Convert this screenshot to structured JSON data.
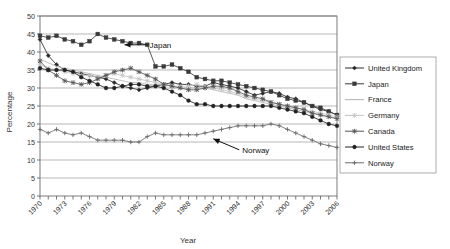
{
  "chart_data": {
    "type": "line",
    "title": "",
    "xlabel": "Year",
    "ylabel": "Percentage",
    "ylim": [
      0,
      50
    ],
    "ytick_step": 5,
    "yticks": [
      "0",
      "5",
      "10",
      "15",
      "20",
      "25",
      "30",
      "35",
      "40",
      "45",
      "50"
    ],
    "xlim": [
      1970,
      2006
    ],
    "xtick_step": 1,
    "xtick_labels": [
      "1970",
      "1973",
      "1976",
      "1979",
      "1982",
      "1985",
      "1988",
      "1991",
      "1994",
      "1997",
      "2000",
      "2003",
      "2006"
    ],
    "xtick_label_step": 3,
    "grid": "horizontal",
    "legend_position": "right",
    "x": [
      1970,
      1971,
      1972,
      1973,
      1974,
      1975,
      1976,
      1977,
      1978,
      1979,
      1980,
      1981,
      1982,
      1983,
      1984,
      1985,
      1986,
      1987,
      1988,
      1989,
      1990,
      1991,
      1992,
      1993,
      1994,
      1995,
      1996,
      1997,
      1998,
      1999,
      2000,
      2001,
      2002,
      2003,
      2004,
      2005,
      2006
    ],
    "series": [
      {
        "name": "United Kingdom",
        "marker": "diamond",
        "color": "#2b2b2b",
        "values": [
          43.5,
          39.0,
          36.5,
          35.0,
          34.5,
          34.0,
          33.5,
          33.0,
          32.5,
          31.5,
          30.5,
          30.0,
          29.5,
          30.0,
          30.5,
          31.0,
          31.5,
          31.0,
          31.0,
          30.5,
          30.5,
          31.5,
          31.0,
          30.5,
          30.0,
          29.0,
          28.0,
          28.5,
          29.0,
          28.5,
          27.5,
          27.0,
          26.0,
          25.0,
          24.0,
          23.5,
          22.5
        ]
      },
      {
        "name": "Japan",
        "marker": "square",
        "color": "#3a3a3a",
        "values": [
          44.5,
          44.0,
          44.5,
          43.5,
          43.0,
          42.0,
          43.0,
          45.0,
          44.0,
          43.5,
          43.0,
          42.5,
          42.5,
          42.0,
          36.0,
          36.0,
          36.5,
          35.5,
          34.5,
          33.0,
          32.5,
          32.0,
          32.0,
          31.5,
          31.0,
          30.5,
          30.0,
          29.5,
          29.0,
          28.0,
          27.0,
          26.5,
          26.0,
          25.0,
          24.5,
          23.5,
          22.5
        ]
      },
      {
        "name": "France",
        "marker": "line",
        "color": "#b9b9b9",
        "values": [
          38.0,
          37.0,
          36.0,
          35.5,
          35.0,
          34.5,
          34.0,
          33.5,
          33.0,
          32.5,
          32.0,
          31.5,
          31.5,
          31.0,
          31.0,
          31.0,
          30.5,
          30.0,
          30.0,
          30.0,
          30.0,
          29.5,
          29.0,
          28.5,
          28.0,
          27.0,
          26.5,
          26.0,
          25.5,
          25.0,
          24.5,
          24.0,
          23.5,
          23.0,
          22.5,
          22.0,
          21.5
        ]
      },
      {
        "name": "Germany",
        "marker": "x-light",
        "color": "#c8c8c8",
        "values": [
          36.5,
          35.5,
          35.0,
          34.5,
          34.0,
          33.5,
          33.5,
          33.0,
          33.5,
          34.0,
          33.5,
          33.0,
          32.5,
          32.0,
          31.5,
          31.0,
          30.5,
          30.5,
          30.5,
          31.0,
          30.5,
          30.0,
          29.5,
          29.0,
          28.5,
          27.5,
          27.0,
          26.5,
          26.0,
          25.5,
          25.0,
          24.5,
          24.0,
          23.5,
          23.0,
          22.5,
          22.0
        ]
      },
      {
        "name": "Canada",
        "marker": "x-dark",
        "color": "#555555",
        "values": [
          37.5,
          35.0,
          33.5,
          32.0,
          31.5,
          31.0,
          31.5,
          32.5,
          33.5,
          34.5,
          35.0,
          35.5,
          34.5,
          33.5,
          32.5,
          31.0,
          30.5,
          30.0,
          29.5,
          29.5,
          30.0,
          30.5,
          30.5,
          30.0,
          29.0,
          28.0,
          27.5,
          27.0,
          26.0,
          25.5,
          25.0,
          24.5,
          24.0,
          23.0,
          22.5,
          22.0,
          21.5
        ]
      },
      {
        "name": "United States",
        "marker": "circle",
        "color": "#222222",
        "values": [
          35.5,
          35.0,
          35.0,
          35.0,
          34.5,
          33.0,
          32.0,
          31.0,
          30.0,
          30.0,
          30.5,
          31.0,
          31.0,
          30.5,
          30.5,
          30.0,
          29.0,
          28.0,
          26.5,
          25.5,
          25.5,
          25.0,
          25.0,
          25.0,
          25.0,
          25.0,
          25.0,
          25.0,
          25.0,
          24.5,
          24.0,
          23.5,
          23.0,
          22.0,
          21.0,
          20.0,
          19.5
        ]
      },
      {
        "name": "Norway",
        "marker": "plus",
        "color": "#6b6b6b",
        "values": [
          18.5,
          17.5,
          18.5,
          17.5,
          17.0,
          17.5,
          16.5,
          15.5,
          15.5,
          15.5,
          15.5,
          15.0,
          15.0,
          16.5,
          17.5,
          17.0,
          17.0,
          17.0,
          17.0,
          17.0,
          17.5,
          18.0,
          18.5,
          19.0,
          19.5,
          19.5,
          19.5,
          19.5,
          20.0,
          19.5,
          18.5,
          17.5,
          16.5,
          15.5,
          14.5,
          14.0,
          13.5
        ]
      }
    ],
    "annotations": [
      {
        "label": "Japan",
        "x": 1980,
        "y": 42.0,
        "style": "arrow-left"
      },
      {
        "label": "Norway",
        "x": 1991,
        "y": 17.0,
        "style": "arrow-diagonal"
      }
    ]
  }
}
